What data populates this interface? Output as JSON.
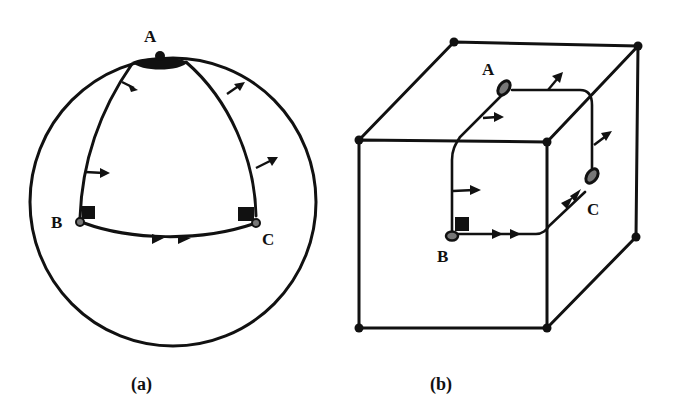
{
  "figure": {
    "panels": [
      {
        "id": "a",
        "caption": "(a)",
        "surface": "sphere",
        "points": [
          {
            "label": "A",
            "position": "top (pole)"
          },
          {
            "label": "B",
            "position": "left equator"
          },
          {
            "label": "C",
            "position": "right equator"
          }
        ],
        "path": [
          "A",
          "B",
          "C",
          "A"
        ]
      },
      {
        "id": "b",
        "caption": "(b)",
        "surface": "cube",
        "points": [
          {
            "label": "A",
            "position": "top face"
          },
          {
            "label": "B",
            "position": "front face"
          },
          {
            "label": "C",
            "position": "right face"
          }
        ],
        "path": [
          "A",
          "B",
          "C",
          "A"
        ]
      }
    ],
    "colors": {
      "ink": "#111111",
      "background": "#ffffff"
    }
  }
}
